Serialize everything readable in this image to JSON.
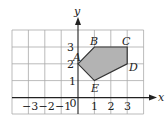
{
  "diagram": {
    "type": "coordinate-grid-polygon",
    "axes": {
      "x_label": "x",
      "y_label": "y",
      "origin_label": "0",
      "x_ticks": [
        {
          "value": -3,
          "label": "−3"
        },
        {
          "value": -2,
          "label": "−2"
        },
        {
          "value": -1,
          "label": "−1"
        },
        {
          "value": 1,
          "label": "1"
        },
        {
          "value": 2,
          "label": "2"
        },
        {
          "value": 3,
          "label": "3"
        }
      ],
      "y_ticks": [
        {
          "value": 1,
          "label": "1"
        },
        {
          "value": 2,
          "label": "2"
        },
        {
          "value": 3,
          "label": "3"
        }
      ],
      "x_range": [
        -4,
        4
      ],
      "y_range": [
        -1,
        4
      ]
    },
    "polygon": {
      "fill": "#b3b3b3",
      "stroke": "#333333",
      "vertices": [
        {
          "label": "A",
          "x": 0,
          "y": 2
        },
        {
          "label": "B",
          "x": 1,
          "y": 3
        },
        {
          "label": "C",
          "x": 3,
          "y": 3
        },
        {
          "label": "D",
          "x": 3,
          "y": 2
        },
        {
          "label": "E",
          "x": 1,
          "y": 1
        }
      ]
    }
  }
}
